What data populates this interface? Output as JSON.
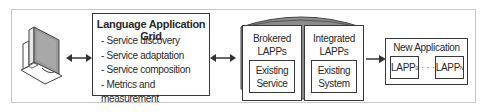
{
  "diagram": {
    "client": {
      "icon": "computer-monitor-icon"
    },
    "language_application_grid": {
      "title": "Language Application Grid",
      "features": [
        "- Service discovery",
        "- Service adaptation",
        "- Service composition",
        "- Metrics and measurement"
      ]
    },
    "lapp_repository": {
      "shape": "cylinder",
      "brokered": {
        "label_line1": "Brokered",
        "label_line2": "LAPPs",
        "inner_line1": "Existing",
        "inner_line2": "Service"
      },
      "integrated": {
        "label_line1": "Integrated",
        "label_line2": "LAPPs",
        "inner_line1": "Existing",
        "inner_line2": "System"
      }
    },
    "new_application": {
      "title": "New Application",
      "first": {
        "label": "LAPP",
        "subscript": "0"
      },
      "ellipsis": "· · ·",
      "last": {
        "label": "LAPP",
        "subscript": "N"
      }
    },
    "connections": [
      {
        "from": "client",
        "to": "language_application_grid",
        "type": "bidirectional"
      },
      {
        "from": "language_application_grid",
        "to": "lapp_repository",
        "type": "bidirectional"
      },
      {
        "from": "lapp_repository",
        "to": "new_application",
        "type": "directed"
      }
    ],
    "colors": {
      "stroke": "#3a3a3a",
      "cylinder_fill": "#8c8c8c",
      "monitor_screen": "#9a9a9a",
      "frame": "#c8c8c8"
    }
  }
}
